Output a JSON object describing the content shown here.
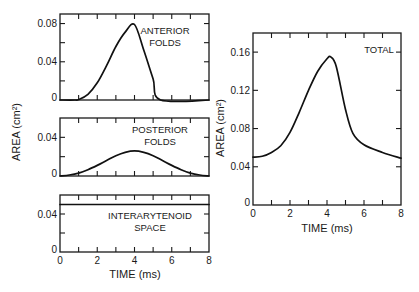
{
  "colors": {
    "ink": "#111111",
    "background": "#ffffff"
  },
  "chart_data": [
    {
      "type": "line",
      "id": "anterior",
      "title": "",
      "annotation": [
        "ANTERIOR",
        "FOLDS"
      ],
      "xlabel": "",
      "ylabel": "",
      "xlim": [
        0,
        8
      ],
      "ylim": [
        0,
        0.09
      ],
      "xticks": [
        0,
        1,
        2,
        3,
        4,
        5,
        6,
        7,
        8
      ],
      "xtick_labels": [],
      "yticks": [
        0,
        0.02,
        0.04,
        0.06,
        0.08
      ],
      "ytick_labels": {
        "0": "0",
        "0.04": "0.04",
        "0.08": "0.08"
      },
      "grid": false,
      "series": [
        {
          "name": "Anterior folds",
          "x": [
            0,
            0.8,
            1.0,
            1.5,
            2.0,
            2.5,
            3.0,
            3.5,
            4.0,
            4.5,
            5.0,
            5.4,
            8.0
          ],
          "y": [
            0,
            0,
            0.0005,
            0.006,
            0.018,
            0.036,
            0.056,
            0.071,
            0.079,
            0.052,
            0.022,
            0,
            0
          ]
        }
      ]
    },
    {
      "type": "line",
      "id": "posterior",
      "annotation": [
        "POSTERIOR",
        "FOLDS"
      ],
      "xlabel": "",
      "ylabel": "AREA (cm²)",
      "xlim": [
        0,
        8
      ],
      "ylim": [
        0,
        0.06
      ],
      "xticks": [
        0,
        1,
        2,
        3,
        4,
        5,
        6,
        7,
        8
      ],
      "xtick_labels": [],
      "yticks": [
        0,
        0.02,
        0.04
      ],
      "ytick_labels": {
        "0": "0",
        "0.04": "0.04"
      },
      "grid": false,
      "series": [
        {
          "name": "Posterior folds",
          "x": [
            0,
            0.5,
            1,
            1.5,
            2,
            2.5,
            3,
            3.5,
            4,
            4.5,
            5,
            5.5,
            6,
            6.5,
            7,
            7.5,
            8
          ],
          "y": [
            0,
            0.001,
            0.003,
            0.0065,
            0.011,
            0.016,
            0.021,
            0.0245,
            0.026,
            0.0245,
            0.021,
            0.016,
            0.011,
            0.0065,
            0.003,
            0.001,
            0
          ]
        }
      ]
    },
    {
      "type": "line",
      "id": "interarytenoid",
      "annotation": [
        "INTERARYTENOID",
        "SPACE"
      ],
      "xlabel": "TIME (ms)",
      "ylabel": "",
      "xlim": [
        0,
        8
      ],
      "ylim": [
        0,
        0.06
      ],
      "xticks": [
        0,
        1,
        2,
        3,
        4,
        5,
        6,
        7,
        8
      ],
      "xtick_labels": {
        "0": "0",
        "2": "2",
        "4": "4",
        "6": "6",
        "8": "8"
      },
      "yticks": [
        0,
        0.02,
        0.04
      ],
      "ytick_labels": {
        "0": "0",
        "0.04": "0.04"
      },
      "grid": false,
      "series": [
        {
          "name": "Interarytenoid space",
          "x": [
            0,
            8
          ],
          "y": [
            0.05,
            0.05
          ]
        }
      ]
    },
    {
      "type": "line",
      "id": "total",
      "annotation": [
        "TOTAL"
      ],
      "xlabel": "TIME (ms)",
      "ylabel": "AREA (cm²)",
      "xlim": [
        0,
        8
      ],
      "ylim": [
        0,
        0.18
      ],
      "xticks": [
        0,
        1,
        2,
        3,
        4,
        5,
        6,
        7,
        8
      ],
      "xtick_labels": {
        "0": "0",
        "2": "2",
        "4": "4",
        "6": "6",
        "8": "8"
      },
      "yticks": [
        0,
        0.04,
        0.08,
        0.12,
        0.16
      ],
      "ytick_labels": {
        "0": "0",
        "0.04": "0.04",
        "0.08": "0.08",
        "0.12": "0.12",
        "0.16": "0.16"
      },
      "grid": false,
      "series": [
        {
          "name": "Total",
          "x": [
            0,
            0.5,
            1.0,
            1.5,
            2.0,
            2.5,
            3.0,
            3.5,
            4.0,
            4.2,
            4.5,
            5.0,
            5.4,
            6.0,
            7.0,
            8.0
          ],
          "y": [
            0.05,
            0.051,
            0.055,
            0.062,
            0.076,
            0.097,
            0.12,
            0.14,
            0.153,
            0.155,
            0.145,
            0.1,
            0.075,
            0.063,
            0.055,
            0.049
          ]
        }
      ]
    }
  ],
  "labels": {
    "left_ylabel": "AREA (cm²)",
    "left_xlabel": "TIME (ms)",
    "right_ylabel": "AREA (cm²)",
    "right_xlabel": "TIME (ms)"
  }
}
